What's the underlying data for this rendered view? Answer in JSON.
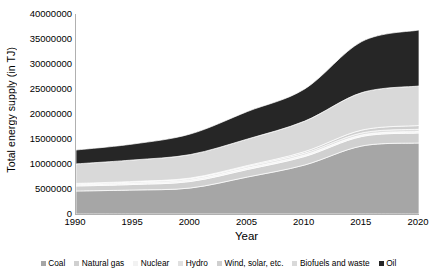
{
  "chart_data": {
    "type": "area",
    "title": "",
    "xlabel": "Year",
    "ylabel": "Total energy supply (in TJ)",
    "x": [
      1990,
      1995,
      2000,
      2005,
      2010,
      2015,
      2020
    ],
    "xticklabels": [
      "1990",
      "1995",
      "2000",
      "2005",
      "2010",
      "2015",
      "2020"
    ],
    "yticklabels": [
      "0",
      "5000000",
      "10000000",
      "15000000",
      "20000000",
      "25000000",
      "30000000",
      "35000000",
      "40000000"
    ],
    "ytickvalues": [
      0,
      5000000,
      10000000,
      15000000,
      20000000,
      25000000,
      30000000,
      35000000,
      40000000
    ],
    "xlim": [
      1990,
      2020
    ],
    "ylim": [
      0,
      40000000
    ],
    "grid": false,
    "stacked": true,
    "legend_position": "bottom",
    "series": [
      {
        "name": "Coal",
        "color": "#a6a6a6",
        "values": [
          4600000,
          4800000,
          5200000,
          7400000,
          9800000,
          13600000,
          14200000
        ]
      },
      {
        "name": "Natural gas",
        "color": "#d0d0d0",
        "values": [
          1000000,
          1100000,
          1300000,
          1500000,
          1700000,
          1900000,
          2000000
        ]
      },
      {
        "name": "Nuclear",
        "color": "#f2f2f2",
        "values": [
          260000,
          300000,
          320000,
          330000,
          320000,
          300000,
          310000
        ]
      },
      {
        "name": "Hydro",
        "color": "#e0e0e0",
        "values": [
          200000,
          230000,
          260000,
          300000,
          360000,
          420000,
          450000
        ]
      },
      {
        "name": "Wind, solar, etc.",
        "color": "#cfcfcf",
        "values": [
          60000,
          80000,
          110000,
          170000,
          300000,
          560000,
          740000
        ]
      },
      {
        "name": "Biofuels and waste",
        "color": "#d9d9d9",
        "values": [
          3900000,
          4300000,
          4700000,
          5300000,
          6100000,
          7500000,
          7900000
        ]
      },
      {
        "name": "Oil",
        "color": "#262626",
        "values": [
          2780000,
          3190000,
          4110000,
          5500000,
          6420000,
          10220000,
          11200000
        ]
      }
    ],
    "totals": [
      12800000,
      14000000,
      16000000,
      20500000,
      25000000,
      34500000,
      36800000
    ]
  }
}
